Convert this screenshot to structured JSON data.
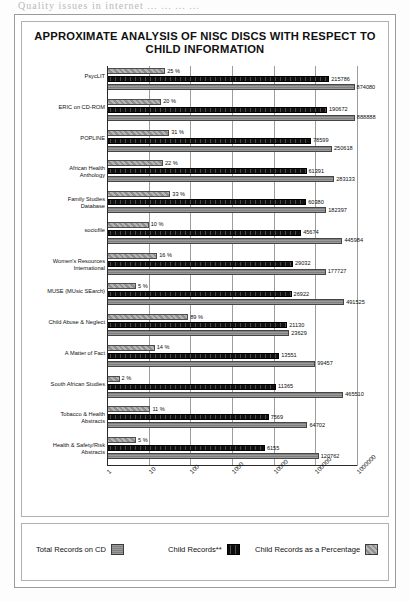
{
  "scan_artifact_text": "Quality issues in internet ...  ...  ...  ...",
  "chart_data": {
    "type": "bar",
    "orientation": "horizontal",
    "title": "APPROXIMATE ANALYSIS OF NISC DISCS WITH RESPECT TO CHILD INFORMATION",
    "xlabel": "",
    "ylabel": "",
    "xscale": "log",
    "xlim": [
      1,
      1000000
    ],
    "xticks": [
      "1",
      "10",
      "100",
      "1000",
      "10000",
      "100000",
      "1000000"
    ],
    "grid": true,
    "legend_position": "bottom",
    "categories": [
      "PsycLIT",
      "ERIC on CD-ROM",
      "POPLINE",
      "African Health\nAnthology",
      "Family Studies\nDatabase",
      "sociofile",
      "Women's Resources\nInternational",
      "MUSE (MUsic SEarch)",
      "Child Abuse & Neglect",
      "A Matter of Fact",
      "South African Studies",
      "Tobacco & Health\nAbstracts",
      "Health & Safety/Risk\nAbstracts"
    ],
    "series": [
      {
        "name": "Total Records on CD",
        "key": "total",
        "values": [
          874080,
          888888,
          250618,
          283133,
          182397,
          445984,
          177727,
          491525,
          23629,
          99457,
          465510,
          64702,
          120762
        ]
      },
      {
        "name": "Child Records**",
        "key": "child",
        "values": [
          215786,
          190672,
          78599,
          61391,
          60380,
          45674,
          29032,
          26922,
          21130,
          13551,
          11365,
          7569,
          6155
        ]
      },
      {
        "name": "Child Records as a Percentage",
        "key": "pct",
        "values": [
          25,
          20,
          31,
          22,
          33,
          10,
          16,
          5,
          89,
          14,
          2,
          11,
          5
        ]
      }
    ],
    "percent_labels": [
      "25 %",
      "20 %",
      "31 %",
      "22 %",
      "33 %",
      "10 %",
      "16 %",
      "5 %",
      "89 %",
      "14 %",
      "2 %",
      "11 %",
      "5 %"
    ],
    "child_labels": [
      "215786",
      "190672",
      "78599",
      "61391",
      "60380",
      "45674",
      "29032",
      "26922",
      "21130",
      "13551",
      "11365",
      "7569",
      "6155"
    ],
    "total_labels": [
      "874080",
      "888888",
      "250618",
      "283133",
      "182397",
      "445984",
      "177727",
      "491525",
      "23629",
      "99457",
      "465510",
      "64702",
      "120762"
    ]
  },
  "legend": {
    "items": [
      {
        "label": "Total Records on CD",
        "key": "total"
      },
      {
        "label": "Child Records**",
        "key": "child"
      },
      {
        "label": "Child Records as a Percentage",
        "key": "pct"
      }
    ]
  }
}
